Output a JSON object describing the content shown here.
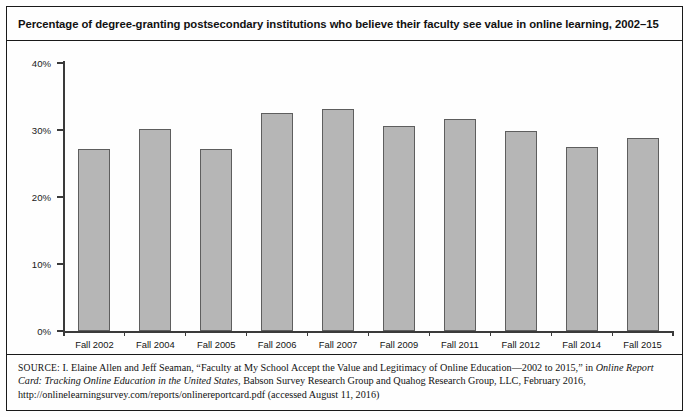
{
  "figure": {
    "title": "Percentage of degree-granting postsecondary institutions who believe their faculty see value in online learning, 2002–15",
    "source_prefix": "SOURCE:",
    "source_part1": " I. Elaine Allen and Jeff Seaman, “Faculty at My School Accept the Value and Legitimacy of Online Education—2002 to 2015,” in ",
    "source_italic1": "Online Report Card: Tracking Online Education in the United States",
    "source_part2": ", Babson Survey Research Group and Quahog Research Group, LLC, February 2016, http://onlinelearningsurvey.com/reports/onlinereportcard.pdf (accessed August 11, 2016)"
  },
  "chart_data": {
    "type": "bar",
    "title": "Percentage of degree-granting postsecondary institutions who believe their faculty see value in online learning, 2002–15",
    "xlabel": "",
    "ylabel": "",
    "categories": [
      "Fall 2002",
      "Fall 2004",
      "Fall 2005",
      "Fall 2006",
      "Fall 2007",
      "Fall 2009",
      "Fall 2011",
      "Fall 2012",
      "Fall 2014",
      "Fall 2015"
    ],
    "values": [
      27.2,
      30.2,
      27.1,
      32.6,
      33.2,
      30.6,
      31.7,
      29.8,
      27.5,
      28.8
    ],
    "ylim": [
      0,
      40
    ],
    "yticks": [
      0,
      10,
      20,
      30,
      40
    ],
    "ytick_labels": [
      "0%",
      "10%",
      "20%",
      "30%",
      "40%"
    ],
    "grid": false,
    "legend": "none",
    "bar_color": "#b6b6b6",
    "bar_border_color": "#5e5e5e",
    "axis_color": "#3a3a3a"
  }
}
